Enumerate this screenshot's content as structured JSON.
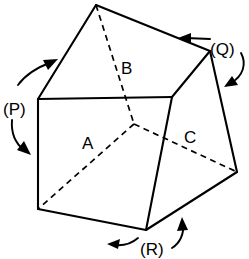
{
  "figure": {
    "background_color": "#ffffff",
    "line_color": "#000000",
    "face_labels": [
      {
        "id": "A",
        "text": "A",
        "x": 82,
        "y": 149
      },
      {
        "id": "B",
        "text": "B",
        "x": 121,
        "y": 74
      },
      {
        "id": "C",
        "text": "C",
        "x": 184,
        "y": 143
      }
    ],
    "rotation_labels": [
      {
        "id": "P",
        "text": "(P)",
        "x": 3,
        "y": 108
      },
      {
        "id": "Q",
        "text": "(Q)",
        "x": 212,
        "y": 52
      },
      {
        "id": "R",
        "text": "(R)",
        "x": 143,
        "y": 254
      }
    ],
    "vertices": {
      "apex_top": "96,5",
      "top_right": "210,51",
      "left_front_top": "38,99",
      "mid_front_top": "172,97",
      "left_front_bottom": "38,209",
      "bottom_front": "146,230",
      "right_bottom": "237,172",
      "hidden_center": "134,124"
    },
    "solid_edges": [
      "96,5 38,99",
      "96,5 210,51",
      "210,51 172,97",
      "172,97 38,99",
      "38,99 38,209",
      "38,209 146,230",
      "146,230 172,97",
      "210,51 237,172",
      "237,172 146,230"
    ],
    "hidden_edges": [
      "96,5 134,124",
      "134,124 38,209",
      "134,124 237,172"
    ],
    "arrows": [
      {
        "id": "P-upper",
        "direction": "up-right"
      },
      {
        "id": "P-lower",
        "direction": "down-right"
      },
      {
        "id": "Q-upper",
        "direction": "left"
      },
      {
        "id": "Q-lower",
        "direction": "down-left"
      },
      {
        "id": "R-left",
        "direction": "left"
      },
      {
        "id": "R-right",
        "direction": "up"
      }
    ]
  }
}
